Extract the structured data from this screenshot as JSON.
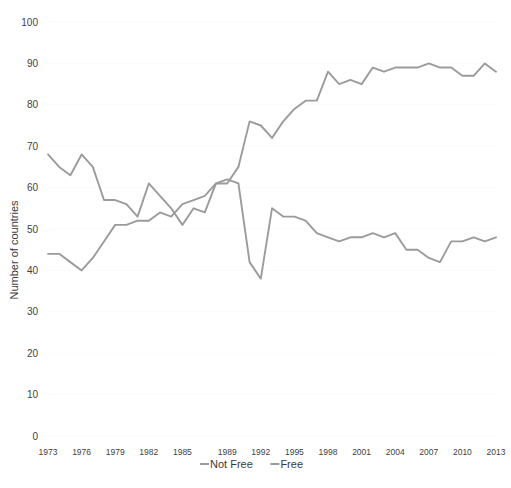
{
  "chart_data": {
    "type": "line",
    "title": "",
    "xlabel": "",
    "ylabel": "Number of countries",
    "ylim": [
      0,
      100
    ],
    "ytick_step": 10,
    "yticks": [
      "0",
      "10",
      "20",
      "30",
      "40",
      "50",
      "60",
      "70",
      "80",
      "90",
      "100"
    ],
    "grid": true,
    "grid_axis": "y",
    "legend_position": "bottom",
    "x": [
      1973,
      1974,
      1975,
      1976,
      1977,
      1978,
      1979,
      1980,
      1981,
      1982,
      1983,
      1984,
      1985,
      1986,
      1987,
      1988,
      1989,
      1990,
      1991,
      1992,
      1993,
      1994,
      1995,
      1996,
      1997,
      1998,
      1999,
      2000,
      2001,
      2002,
      2003,
      2004,
      2005,
      2006,
      2007,
      2008,
      2009,
      2010,
      2011,
      2012,
      2013
    ],
    "xtick_labels": [
      "1973",
      "1976",
      "1979",
      "1982",
      "1985",
      "1989",
      "1992",
      "1995",
      "1998",
      "2001",
      "2004",
      "2007",
      "2010",
      "2013"
    ],
    "xtick_values": [
      1973,
      1976,
      1979,
      1982,
      1985,
      1989,
      1992,
      1995,
      1998,
      2001,
      2004,
      2007,
      2010,
      2013
    ],
    "series": [
      {
        "name": "Not Free",
        "color": "#9b9b9b",
        "values": [
          68,
          65,
          63,
          68,
          65,
          57,
          57,
          56,
          53,
          61,
          58,
          55,
          51,
          55,
          54,
          61,
          62,
          61,
          42,
          38,
          55,
          53,
          53,
          52,
          49,
          48,
          47,
          48,
          48,
          49,
          48,
          49,
          45,
          45,
          43,
          42,
          47,
          47,
          48,
          47,
          48
        ],
        "marker": "none",
        "linewidth": 1.9
      },
      {
        "name": "Free",
        "color": "#9b9b9b",
        "values": [
          44,
          44,
          42,
          40,
          43,
          47,
          51,
          51,
          52,
          52,
          54,
          53,
          56,
          57,
          58,
          61,
          61,
          65,
          76,
          75,
          72,
          76,
          79,
          81,
          81,
          88,
          85,
          86,
          85,
          89,
          88,
          89,
          89,
          89,
          90,
          89,
          89,
          87,
          87,
          90,
          88
        ],
        "marker": "none",
        "linewidth": 1.9
      }
    ],
    "legend": [
      {
        "label": "Not Free",
        "color": "#9b9b9b"
      },
      {
        "label": "Free",
        "color": "#9b9b9b"
      }
    ]
  },
  "plot_geometry": {
    "left": 48,
    "right": 496,
    "top": 22,
    "bottom": 436,
    "x_domain_min": 1973,
    "x_domain_max": 2013
  }
}
